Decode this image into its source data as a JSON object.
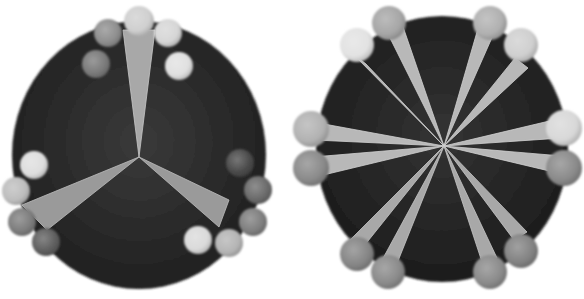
{
  "figure": {
    "panels": [
      {
        "id": "left",
        "disc": {
          "cx": 139,
          "cy": 155,
          "rx": 127,
          "ry": 134,
          "fill_center": "#3a3a3a",
          "fill_edge": "#1e1e1e"
        },
        "hub": {
          "x": 139,
          "y": 157
        },
        "wedges": [
          {
            "tip": [
              139,
              157
            ],
            "base": [
              [
                123,
                30
              ],
              [
                155,
                30
              ]
            ],
            "fill": "#a8a8a8"
          },
          {
            "tip": [
              139,
              157
            ],
            "base": [
              [
                22,
                205
              ],
              [
                47,
                230
              ]
            ],
            "fill": "#9a9a9a"
          },
          {
            "tip": [
              139,
              157
            ],
            "base": [
              [
                229,
                200
              ],
              [
                219,
                227
              ]
            ],
            "fill": "#9a9a9a"
          }
        ],
        "spheres": [
          {
            "x": 139,
            "y": 21,
            "r": 15,
            "fill": "#cfcfcf"
          },
          {
            "x": 108,
            "y": 33,
            "r": 14,
            "fill": "#8e8e8e"
          },
          {
            "x": 168,
            "y": 33,
            "r": 14,
            "fill": "#d6d6d6"
          },
          {
            "x": 96,
            "y": 64,
            "r": 14,
            "fill": "#7a7a7a"
          },
          {
            "x": 179,
            "y": 66,
            "r": 14,
            "fill": "#e0e0e0"
          },
          {
            "x": 34,
            "y": 165,
            "r": 14,
            "fill": "#dedede"
          },
          {
            "x": 16,
            "y": 191,
            "r": 14,
            "fill": "#bdbdbd"
          },
          {
            "x": 22,
            "y": 222,
            "r": 14,
            "fill": "#7c7c7c"
          },
          {
            "x": 46,
            "y": 242,
            "r": 14,
            "fill": "#5e5e5e"
          },
          {
            "x": 240,
            "y": 163,
            "r": 14,
            "fill": "#4a4a4a"
          },
          {
            "x": 258,
            "y": 190,
            "r": 14,
            "fill": "#6a6a6a"
          },
          {
            "x": 253,
            "y": 222,
            "r": 14,
            "fill": "#7e7e7e"
          },
          {
            "x": 198,
            "y": 240,
            "r": 14,
            "fill": "#dadada"
          },
          {
            "x": 229,
            "y": 243,
            "r": 14,
            "fill": "#b4b4b4"
          }
        ]
      },
      {
        "id": "right",
        "disc": {
          "cx": 442,
          "cy": 149,
          "rx": 126,
          "ry": 133,
          "fill_center": "#333333",
          "fill_edge": "#1b1b1b"
        },
        "hub": {
          "x": 444,
          "y": 146
        },
        "wedges": [
          {
            "tip": [
              444,
              146
            ],
            "base": [
              [
                382,
                22
              ],
              [
                400,
                18
              ]
            ],
            "fill": "#b8b8b8"
          },
          {
            "tip": [
              444,
              146
            ],
            "base": [
              [
                351,
                52
              ],
              [
                366,
                64
              ]
            ],
            "fill": "#b8b8b8"
          },
          {
            "tip": [
              444,
              146
            ],
            "base": [
              [
                481,
                18
              ],
              [
                498,
                24
              ]
            ],
            "fill": "#b8b8b8"
          },
          {
            "tip": [
              444,
              146
            ],
            "base": [
              [
                515,
                58
              ],
              [
                528,
                68
              ]
            ],
            "fill": "#b8b8b8"
          },
          {
            "tip": [
              444,
              146
            ],
            "base": [
              [
                313,
                122
              ],
              [
                314,
                140
              ]
            ],
            "fill": "#b8b8b8"
          },
          {
            "tip": [
              444,
              146
            ],
            "base": [
              [
                313,
                157
              ],
              [
                315,
                177
              ]
            ],
            "fill": "#b8b8b8"
          },
          {
            "tip": [
              444,
              146
            ],
            "base": [
              [
                562,
                118
              ],
              [
                562,
                138
              ]
            ],
            "fill": "#b8b8b8"
          },
          {
            "tip": [
              444,
              146
            ],
            "base": [
              [
                562,
                156
              ],
              [
                562,
                174
              ]
            ],
            "fill": "#b8b8b8"
          },
          {
            "tip": [
              444,
              146
            ],
            "base": [
              [
                350,
                240
              ],
              [
                364,
                246
              ]
            ],
            "fill": "#a8a8a8"
          },
          {
            "tip": [
              444,
              146
            ],
            "base": [
              [
                381,
                262
              ],
              [
                396,
                266
              ]
            ],
            "fill": "#a8a8a8"
          },
          {
            "tip": [
              444,
              146
            ],
            "base": [
              [
                482,
                262
              ],
              [
                497,
                258
              ]
            ],
            "fill": "#a8a8a8"
          },
          {
            "tip": [
              444,
              146
            ],
            "base": [
              [
                514,
                240
              ],
              [
                527,
                232
              ]
            ],
            "fill": "#a8a8a8"
          }
        ],
        "spheres": [
          {
            "x": 389,
            "y": 23,
            "r": 17,
            "fill": "#a6a6a6"
          },
          {
            "x": 357,
            "y": 45,
            "r": 17,
            "fill": "#e2e2e2"
          },
          {
            "x": 490,
            "y": 23,
            "r": 17,
            "fill": "#b0b0b0"
          },
          {
            "x": 521,
            "y": 45,
            "r": 17,
            "fill": "#cfcfcf"
          },
          {
            "x": 311,
            "y": 129,
            "r": 18,
            "fill": "#b2b2b2"
          },
          {
            "x": 311,
            "y": 168,
            "r": 18,
            "fill": "#8a8a8a"
          },
          {
            "x": 564,
            "y": 128,
            "r": 18,
            "fill": "#d8d8d8"
          },
          {
            "x": 564,
            "y": 168,
            "r": 18,
            "fill": "#8a8a8a"
          },
          {
            "x": 357,
            "y": 254,
            "r": 17,
            "fill": "#858585"
          },
          {
            "x": 388,
            "y": 272,
            "r": 17,
            "fill": "#8a8a8a"
          },
          {
            "x": 490,
            "y": 272,
            "r": 17,
            "fill": "#8a8a8a"
          },
          {
            "x": 521,
            "y": 251,
            "r": 17,
            "fill": "#828282"
          }
        ]
      }
    ]
  }
}
